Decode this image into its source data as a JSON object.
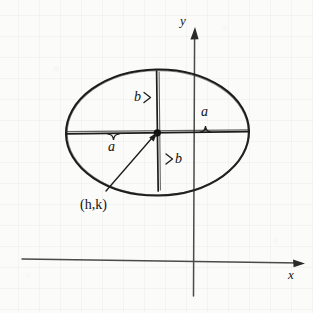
{
  "figure": {
    "kind": "geometry-diagram",
    "background_color": "#fbfbfa",
    "ink_color": "#131313",
    "axis_color": "#4a4a4a",
    "grid_color": "#787d82"
  },
  "axes": {
    "x_label": "x",
    "y_label": "y",
    "x_axis": {
      "x1": 22,
      "y1": 259,
      "x2": 303,
      "y2": 263,
      "arrow": "right"
    },
    "y_axis": {
      "x1": 193,
      "y1": 296,
      "x2": 195,
      "y2": 28,
      "arrow": "up"
    },
    "x_label_pos": {
      "x": 288,
      "y": 268
    },
    "y_label_pos": {
      "x": 180,
      "y": 14
    }
  },
  "ellipse": {
    "center": {
      "x": 157,
      "y": 133
    },
    "semi_axis_horizontal": 91,
    "semi_axis_vertical": 63,
    "center_label": "(h,k)",
    "center_label_pos": {
      "x": 80,
      "y": 198
    }
  },
  "labels": {
    "semi_major_left": "a",
    "semi_major_right": "a",
    "semi_minor_top": "b",
    "semi_minor_bottom": "b",
    "a_left_pos": {
      "x": 108,
      "y": 140
    },
    "a_right_pos": {
      "x": 201,
      "y": 105
    },
    "b_top_pos": {
      "x": 134,
      "y": 90
    },
    "b_bottom_pos": {
      "x": 175,
      "y": 152
    }
  },
  "segments": {
    "horizontal_major": {
      "x1": 66,
      "y1": 133,
      "x2": 249,
      "y2": 132
    },
    "vertical_minor": {
      "x1": 157,
      "y1": 71,
      "x2": 158,
      "y2": 191
    },
    "leader_line": {
      "x1": 106,
      "y1": 191,
      "x2": 156,
      "y2": 134
    }
  }
}
